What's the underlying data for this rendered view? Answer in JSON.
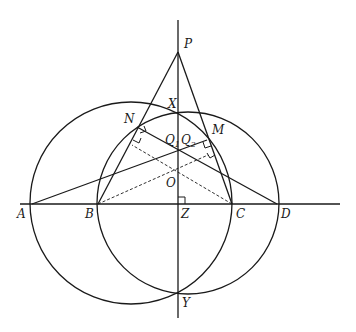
{
  "diagram": {
    "type": "geometry",
    "labels": {
      "P": "P",
      "X": "X",
      "N": "N",
      "M": "M",
      "Q1": "Q",
      "Q1_sub": "1",
      "Q2": "Q",
      "Q2_sub": "2",
      "O": "O",
      "A": "A",
      "B": "B",
      "Z": "Z",
      "C": "C",
      "D": "D",
      "Y": "Y"
    },
    "colors": {
      "stroke": "#1a1a1a",
      "background": "#ffffff"
    },
    "points": {
      "P": [
        178,
        52
      ],
      "X": [
        178,
        112
      ],
      "N": [
        137,
        127
      ],
      "M": [
        207,
        140
      ],
      "Q": [
        178,
        148
      ],
      "O": [
        178,
        174
      ],
      "A": [
        32,
        204
      ],
      "B": [
        98,
        204
      ],
      "Z": [
        178,
        204
      ],
      "C": [
        232,
        204
      ],
      "D": [
        277,
        204
      ],
      "Y": [
        178,
        294
      ]
    },
    "circles": [
      {
        "name": "circle-ACXY",
        "center": [
          131,
          203
        ],
        "r": 101
      },
      {
        "name": "circle-BDXY",
        "center": [
          188,
          203
        ],
        "r": 91
      }
    ]
  }
}
